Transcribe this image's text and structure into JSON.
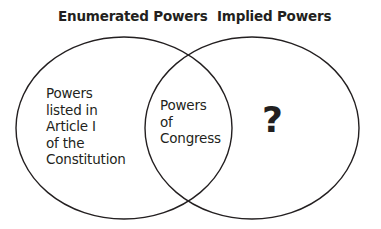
{
  "diagram": {
    "type": "venn",
    "sets": [
      {
        "label": "Enumerated Powers",
        "region_text": [
          "Powers",
          "listed in",
          "Article I",
          "of the",
          "Constitution"
        ]
      },
      {
        "label": "Implied Powers",
        "region_text": [
          "?"
        ]
      }
    ],
    "intersection": {
      "region_text": [
        "Powers",
        "of",
        "Congress"
      ]
    },
    "colors": {
      "stroke": "#231f20",
      "text": "#231f20",
      "background": "#ffffff"
    }
  }
}
